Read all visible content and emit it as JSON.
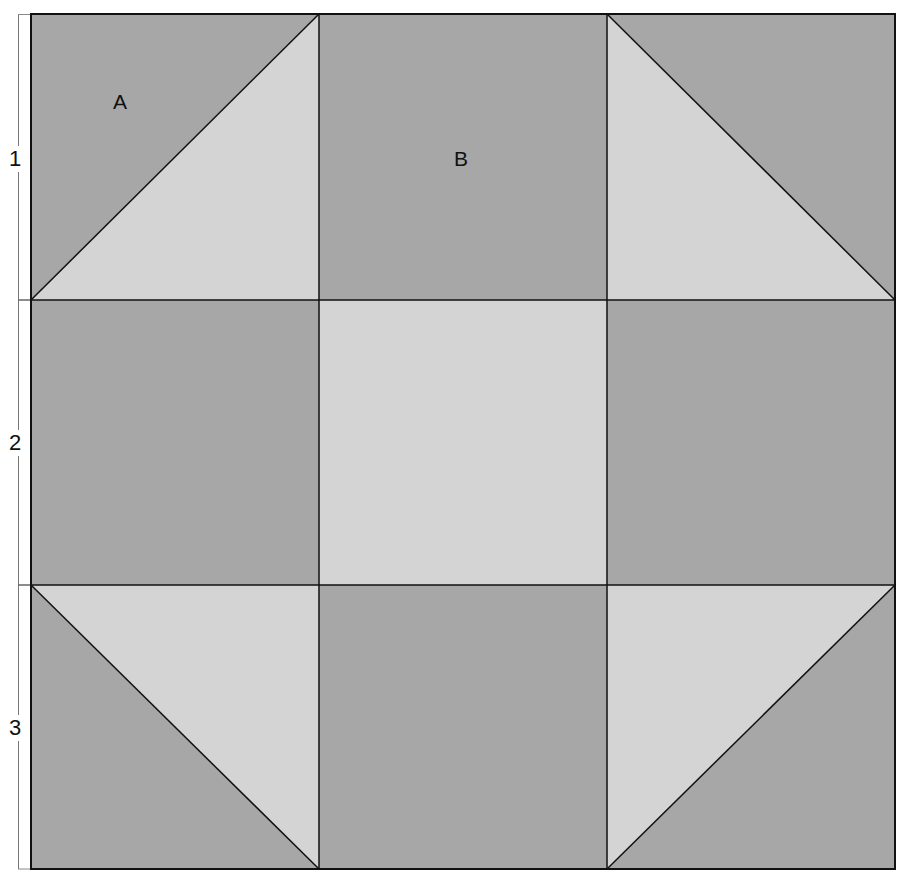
{
  "diagram": {
    "type": "quilt-block",
    "grid": {
      "rows": 3,
      "cols": 3
    },
    "colors": {
      "dark": "#a7a7a7",
      "light": "#d4d4d4",
      "line": "#111111",
      "ruler": "#777777"
    },
    "row_labels": [
      "1",
      "2",
      "3"
    ],
    "piece_labels": [
      {
        "text": "A",
        "cell": "row1-col1"
      },
      {
        "text": "B",
        "cell": "row1-col2"
      }
    ],
    "cells": [
      {
        "id": "r1c1",
        "kind": "half-square-triangle",
        "dark": "top-left",
        "light": "bottom-right"
      },
      {
        "id": "r1c2",
        "kind": "square",
        "shade": "dark"
      },
      {
        "id": "r1c3",
        "kind": "half-square-triangle",
        "dark": "top-right",
        "light": "bottom-left"
      },
      {
        "id": "r2c1",
        "kind": "square",
        "shade": "dark"
      },
      {
        "id": "r2c2",
        "kind": "square",
        "shade": "light"
      },
      {
        "id": "r2c3",
        "kind": "square",
        "shade": "dark"
      },
      {
        "id": "r3c1",
        "kind": "half-square-triangle",
        "dark": "bottom-left",
        "light": "top-right"
      },
      {
        "id": "r3c2",
        "kind": "square",
        "shade": "dark"
      },
      {
        "id": "r3c3",
        "kind": "half-square-triangle",
        "dark": "bottom-right",
        "light": "top-left"
      }
    ]
  }
}
